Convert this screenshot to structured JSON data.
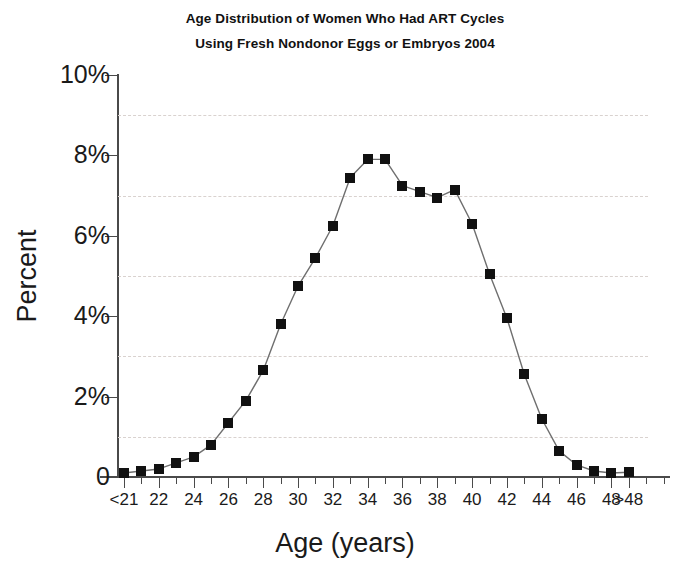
{
  "title": {
    "line1": "Age Distribution of Women Who Had ART Cycles",
    "line2": "Using Fresh Nondonor Eggs or Embryos 2004"
  },
  "axes": {
    "y_title": "Percent",
    "x_title": "Age (years)",
    "y_ticklabels": [
      "0",
      "2%",
      "4%",
      "6%",
      "8%",
      "10%"
    ],
    "y_tickvalues": [
      0,
      2,
      4,
      6,
      8,
      10
    ],
    "gridline_values": [
      1,
      3,
      5,
      7,
      9
    ],
    "x_ticklabels": [
      "<21",
      "22",
      "24",
      "26",
      "28",
      "30",
      "32",
      "34",
      "36",
      "38",
      "40",
      "42",
      "44",
      "46",
      "48",
      ">48"
    ]
  },
  "chart_data": {
    "type": "line",
    "title": "Age Distribution of Women Who Had ART Cycles Using Fresh Nondonor Eggs or Embryos 2004",
    "xlabel": "Age (years)",
    "ylabel": "Percent",
    "ylim": [
      0,
      10
    ],
    "grid": true,
    "legend": null,
    "marker": "square",
    "color": "#111111",
    "categories": [
      "<21",
      "21",
      "22",
      "23",
      "24",
      "25",
      "26",
      "27",
      "28",
      "29",
      "30",
      "31",
      "32",
      "33",
      "34",
      "35",
      "36",
      "37",
      "38",
      "39",
      "40",
      "41",
      "42",
      "43",
      "44",
      "45",
      "46",
      "47",
      "48",
      ">48"
    ],
    "values": [
      0.1,
      0.15,
      0.2,
      0.35,
      0.5,
      0.8,
      1.35,
      1.9,
      2.65,
      3.8,
      4.75,
      5.45,
      6.25,
      7.45,
      7.9,
      7.9,
      7.25,
      7.1,
      6.95,
      7.15,
      6.3,
      5.05,
      3.95,
      2.55,
      1.45,
      0.65,
      0.3,
      0.15,
      0.1,
      0.12
    ]
  }
}
